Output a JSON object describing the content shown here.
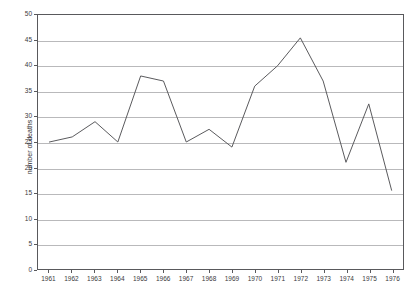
{
  "chart_data": {
    "type": "line",
    "title": "",
    "xlabel": "",
    "ylabel": "number of deaths",
    "categories": [
      "1961",
      "1962",
      "1963",
      "1964",
      "1965",
      "1966",
      "1967",
      "1968",
      "1969",
      "1970",
      "1971",
      "1972",
      "1973",
      "1974",
      "1975",
      "1976"
    ],
    "values": [
      25,
      26,
      29,
      25,
      38,
      37,
      25,
      27.5,
      24,
      36,
      40,
      45.5,
      37,
      21,
      32.5,
      15.5
    ],
    "series": [
      {
        "name": "number of deaths",
        "values": [
          25,
          26,
          29,
          25,
          38,
          37,
          25,
          27.5,
          24,
          36,
          40,
          45.5,
          37,
          21,
          32.5,
          15.5
        ]
      }
    ],
    "ylim": [
      0,
      50
    ],
    "ytick_values": [
      0,
      5,
      10,
      15,
      20,
      25,
      30,
      35,
      40,
      45,
      50
    ],
    "ytick_labels": [
      "0",
      "5",
      "10",
      "15",
      "20",
      "25",
      "30",
      "35",
      "40",
      "45",
      "50"
    ],
    "xtick_labels": [
      "1961",
      "1962",
      "1963",
      "1964",
      "1965",
      "1966",
      "1967",
      "1968",
      "1969",
      "1970",
      "1971",
      "1972",
      "1973",
      "1974",
      "1975",
      "1976"
    ],
    "grid": true,
    "grid_axis": "y",
    "legend": "none",
    "line_color": "#59595c",
    "grid_color": "#b9b9bb",
    "axis_color": "#59595c",
    "background_color": "#ffffff",
    "markers": "none"
  }
}
